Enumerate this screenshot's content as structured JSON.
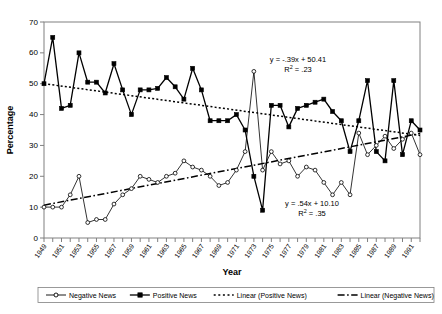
{
  "chart_data": {
    "type": "line",
    "title": "",
    "xlabel": "Year",
    "ylabel": "Percentage",
    "ylim": [
      0,
      70
    ],
    "ytick_step": 10,
    "yticks": [
      0,
      10,
      20,
      30,
      40,
      50,
      60,
      70
    ],
    "xlim": [
      1949,
      1992
    ],
    "grid": false,
    "legend_position": "bottom",
    "x": [
      1949,
      1950,
      1951,
      1952,
      1953,
      1954,
      1955,
      1956,
      1957,
      1958,
      1959,
      1960,
      1961,
      1962,
      1963,
      1964,
      1965,
      1966,
      1967,
      1968,
      1969,
      1970,
      1971,
      1972,
      1973,
      1974,
      1975,
      1976,
      1977,
      1978,
      1979,
      1980,
      1981,
      1982,
      1983,
      1984,
      1985,
      1986,
      1987,
      1988,
      1989,
      1990,
      1991,
      1992
    ],
    "xtick_labels": [
      "1949",
      "1951",
      "1953",
      "1955",
      "1957",
      "1959",
      "1961",
      "1963",
      "1965",
      "1967",
      "1969",
      "1971",
      "1973",
      "1975",
      "1977",
      "1979",
      "1981",
      "1983",
      "1985",
      "1987",
      "1989",
      "1991"
    ],
    "series": [
      {
        "name": "Positive News",
        "marker": "filled-square",
        "values": [
          50,
          65,
          42,
          43,
          60,
          50.5,
          50.5,
          47,
          56.5,
          48,
          40,
          48,
          48,
          48.5,
          52,
          49,
          45,
          55,
          48,
          38,
          38,
          38,
          40,
          35,
          20,
          9,
          43,
          43,
          36,
          42,
          43,
          44,
          45,
          41,
          38,
          28,
          38,
          51,
          28,
          25,
          51,
          27,
          38,
          35
        ]
      },
      {
        "name": "Negative News",
        "marker": "open-circle",
        "values": [
          10,
          10,
          10,
          14,
          20,
          5,
          6,
          6,
          11,
          14,
          16,
          20,
          19,
          18,
          20,
          21,
          25,
          23,
          22,
          20,
          17,
          18,
          22,
          28,
          54,
          22,
          28,
          24,
          25,
          20,
          23,
          22,
          18,
          14,
          18,
          14,
          34,
          27,
          30,
          33,
          29,
          32,
          34,
          27
        ]
      }
    ],
    "trendlines": [
      {
        "name": "Linear (Positive News)",
        "style": "dotted",
        "equation": "y = -.39x + 50.41",
        "r2_label": "R",
        "r2_exp": "2",
        "r2_value": "= .23",
        "slope": -0.39,
        "intercept": 50.41,
        "r2": 0.23
      },
      {
        "name": "Linear (Negative News)",
        "style": "dash-dot",
        "equation": "y = .54x + 10.10",
        "r2_label": "R",
        "r2_exp": "2",
        "r2_value": "= .35",
        "slope": 0.54,
        "intercept": 10.1,
        "r2": 0.35
      }
    ],
    "annotations": [
      {
        "id": "pos-eq",
        "line1": "y = -.39x + 50.41",
        "line2_pre": "R",
        "line2_sup": "2",
        "line2_post": " = .23"
      },
      {
        "id": "neg-eq",
        "line1": "y = .54x + 10.10",
        "line2_pre": "R",
        "line2_sup": "2",
        "line2_post": " = .35"
      }
    ],
    "legend": [
      {
        "label": "Negative News",
        "marker": "open-circle",
        "style": "solid"
      },
      {
        "label": "Positive News",
        "marker": "filled-square",
        "style": "solid"
      },
      {
        "label": "Linear (Positive News)",
        "marker": "none",
        "style": "dotted"
      },
      {
        "label": "Linear (Negative News)",
        "marker": "none",
        "style": "dash-dot"
      }
    ],
    "colors": {
      "ink": "#000000",
      "background": "#ffffff",
      "axis": "#808080"
    }
  }
}
